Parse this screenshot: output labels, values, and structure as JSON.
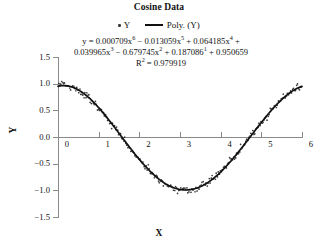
{
  "chart_data": {
    "type": "scatter",
    "title": "Cosine Data",
    "xlabel": "X",
    "ylabel": "Y",
    "xlim": [
      0,
      6
    ],
    "ylim": [
      -1.5,
      1.5
    ],
    "xticks": [
      "0",
      "1",
      "2",
      "3",
      "4",
      "5",
      "6"
    ],
    "yticks": [
      "1.5",
      "1.0",
      "0.5",
      "0.0",
      "-0.5",
      "-1.0",
      "-1.5"
    ],
    "grid": false,
    "legend_position": "top-center",
    "legend": [
      {
        "label": "Y",
        "marker": "dot",
        "color": "#3a3a3a"
      },
      {
        "label": "Poly. (Y)",
        "marker": "line",
        "color": "#111111"
      }
    ],
    "annotations": {
      "equation_line1": "y = 0.000709x6 − 0.013059x5 + 0.064185x4 +",
      "equation_line2": "0.039965x3 − 0.679745x2 + 0.187086¹ + 0.950659",
      "r_squared": "R2 = 0.979919",
      "r_squared_value": 0.979919
    },
    "equation_terms": [
      {
        "coefficient": "0.000709",
        "power": "6",
        "sign": ""
      },
      {
        "coefficient": "0.013059",
        "power": "5",
        "sign": "−"
      },
      {
        "coefficient": "0.064185",
        "power": "4",
        "sign": "+"
      },
      {
        "coefficient": "0.039965",
        "power": "3",
        "sign": ""
      },
      {
        "coefficient": "0.679745",
        "power": "2",
        "sign": "−"
      },
      {
        "coefficient": "0.187086",
        "power": "1",
        "sign": "+"
      },
      {
        "coefficient": "0.950659",
        "power": "0",
        "sign": "+"
      }
    ],
    "series": [
      {
        "name": "Y",
        "type": "scatter",
        "color": "#3a3a3a",
        "x": [
          0.02,
          0.05,
          0.07,
          0.09,
          0.12,
          0.14,
          0.16,
          0.19,
          0.21,
          0.24,
          0.26,
          0.29,
          0.31,
          0.34,
          0.36,
          0.39,
          0.41,
          0.44,
          0.46,
          0.49,
          0.51,
          0.54,
          0.56,
          0.59,
          0.61,
          0.64,
          0.66,
          0.69,
          0.71,
          0.74,
          0.76,
          0.79,
          0.82,
          0.84,
          0.87,
          0.89,
          0.92,
          0.94,
          0.97,
          0.99,
          1.02,
          1.04,
          1.07,
          1.09,
          1.12,
          1.14,
          1.17,
          1.19,
          1.22,
          1.24,
          1.27,
          1.29,
          1.32,
          1.34,
          1.37,
          1.39,
          1.42,
          1.44,
          1.47,
          1.49,
          1.52,
          1.54,
          1.57,
          1.59,
          1.62,
          1.64,
          1.67,
          1.69,
          1.72,
          1.74,
          1.77,
          1.79,
          1.82,
          1.84,
          1.87,
          1.89,
          1.92,
          1.94,
          1.97,
          1.99,
          2.02,
          2.04,
          2.07,
          2.09,
          2.12,
          2.14,
          2.17,
          2.19,
          2.22,
          2.24,
          2.27,
          2.29,
          2.32,
          2.34,
          2.37,
          2.39,
          2.42,
          2.44,
          2.47,
          2.49,
          2.52,
          2.54,
          2.57,
          2.59,
          2.62,
          2.64,
          2.67,
          2.69,
          2.72,
          2.74,
          2.77,
          2.79,
          2.82,
          2.84,
          2.87,
          2.89,
          2.92,
          2.94,
          2.97,
          2.99,
          3.02,
          3.04,
          3.07,
          3.09,
          3.12,
          3.14,
          3.17,
          3.19,
          3.22,
          3.24,
          3.27,
          3.29,
          3.32,
          3.34,
          3.37,
          3.39,
          3.42,
          3.44,
          3.47,
          3.49,
          3.52,
          3.54,
          3.57,
          3.59,
          3.62,
          3.64,
          3.67,
          3.69,
          3.72,
          3.74,
          3.77,
          3.79,
          3.82,
          3.84,
          3.87,
          3.89,
          3.92,
          3.94,
          3.97,
          3.99,
          4.02,
          4.04,
          4.07,
          4.09,
          4.12,
          4.14,
          4.17,
          4.19,
          4.22,
          4.24,
          4.27,
          4.29,
          4.32,
          4.34,
          4.37,
          4.39,
          4.42,
          4.44,
          4.47,
          4.49,
          4.52,
          4.54,
          4.57,
          4.59,
          4.62,
          4.64,
          4.67,
          4.69,
          4.72,
          4.74,
          4.77,
          4.79,
          4.82,
          4.84,
          4.87,
          4.89,
          4.92,
          4.94,
          4.97,
          4.99,
          5.02,
          5.04,
          5.07,
          5.09,
          5.12,
          5.14,
          5.17,
          5.19,
          5.22,
          5.24,
          5.27,
          5.29,
          5.32,
          5.34,
          5.37,
          5.39,
          5.42,
          5.44,
          5.47,
          5.49,
          5.52,
          5.54,
          5.57,
          5.59,
          5.62,
          5.64,
          5.67,
          5.69,
          5.72,
          5.74,
          5.77,
          5.79,
          5.82,
          5.84,
          5.87,
          5.89,
          5.92,
          5.94,
          5.97,
          5.99
        ],
        "noise_sd": 0.065
      },
      {
        "name": "Poly. (Y)",
        "type": "line",
        "color": "#111111",
        "fit": "6th order polynomial"
      }
    ]
  },
  "chart": {
    "title": "Cosine Data",
    "axis_title_x": "X",
    "axis_title_y": "Y"
  },
  "legend": {
    "scatter_label": "Y",
    "poly_label": "Poly. (Y)"
  },
  "equation": {
    "line1_prefix": "y = 0.000709x",
    "line1_p1": "6",
    "line1_mid1": " − 0.013059x",
    "line1_p2": "5",
    "line1_mid2": " + 0.064185x",
    "line1_p3": "4",
    "line1_suffix": " +",
    "line2_prefix": "0.039965x",
    "line2_p1": "3",
    "line2_mid1": " −  0.679745x",
    "line2_p2": "2",
    "line2_mid2": " + 0.187086",
    "line2_p3": "1",
    "line2_suffix": " + 0.950659",
    "r2_prefix": "R",
    "r2_power": "2",
    "r2_value": " = 0.979919"
  }
}
